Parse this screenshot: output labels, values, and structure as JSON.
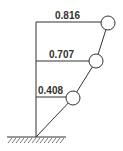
{
  "diagram": {
    "type": "mode-shape",
    "levels": [
      {
        "label": "0.816",
        "value": 0.816
      },
      {
        "label": "0.707",
        "value": 0.707
      },
      {
        "label": "0.408",
        "value": 0.408
      }
    ],
    "ground": "fixed-support"
  }
}
